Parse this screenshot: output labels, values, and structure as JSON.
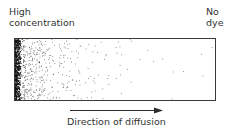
{
  "diagram": {
    "left_label": {
      "line1": "High",
      "line2": "concentration"
    },
    "right_label": {
      "line1": "No",
      "line2": "dye"
    },
    "caption": "Direction of diffusion",
    "arrow": {
      "direction": "left-to-right"
    },
    "gradient": {
      "from": "high density (left)",
      "to": "no dye (right)"
    },
    "colors": {
      "stroke": "#3a3a3a",
      "dots": "#222222",
      "background": "#ffffff"
    }
  }
}
